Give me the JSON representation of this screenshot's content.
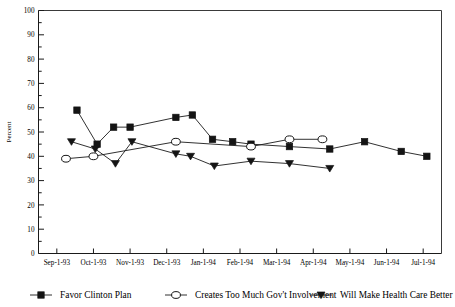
{
  "chart_data": {
    "type": "line",
    "title": "",
    "xlabel": "",
    "ylabel": "Percent",
    "ylim": [
      0,
      100
    ],
    "ytick_step": 10,
    "yminor_step": 5,
    "grid": false,
    "legend_position": "bottom",
    "categories": [
      "Sep-1-93",
      "Oct-1-93",
      "Nov-1-93",
      "Dec-1-93",
      "Jan-1-94",
      "Feb-1-94",
      "Mar-1-94",
      "Apr-1-94",
      "May-1-94",
      "Jun-1-94",
      "Jul-1-94"
    ],
    "ytick_labels": [
      "0",
      "10",
      "20",
      "30",
      "40",
      "50",
      "60",
      "70",
      "80",
      "90",
      "100"
    ],
    "series": [
      {
        "name": "Favor Clinton Plan",
        "marker": "filled-square",
        "x": [
          0.55,
          1.1,
          1.55,
          2.0,
          3.25,
          3.7,
          4.25,
          4.8,
          5.3,
          6.35,
          7.45,
          8.4,
          9.4,
          10.1
        ],
        "values": [
          59,
          45,
          52,
          52,
          56,
          57,
          47,
          46,
          45,
          44,
          43,
          46,
          42,
          40
        ]
      },
      {
        "name": "Creates Too Much Gov't Involvement",
        "marker": "open-circle",
        "x": [
          0.25,
          1.0,
          3.25,
          5.3,
          6.35,
          7.25
        ],
        "values": [
          39,
          40,
          46,
          44,
          47,
          47
        ]
      },
      {
        "name": "Will Make Health Care Better",
        "marker": "filled-triangle",
        "x": [
          0.4,
          1.05,
          1.6,
          2.05,
          3.25,
          3.65,
          4.3,
          5.3,
          6.35,
          7.45
        ],
        "values": [
          46,
          43,
          37,
          46,
          41,
          40,
          36,
          38,
          37,
          35
        ]
      }
    ]
  },
  "legend": {
    "items": [
      {
        "label": "Favor Clinton Plan",
        "marker": "filled-square"
      },
      {
        "label": "Creates Too Much Gov't Involvement",
        "marker": "open-circle"
      },
      {
        "label": "Will Make Health Care Better",
        "marker": "filled-triangle"
      }
    ]
  },
  "axes": {
    "y_axis_title": "Percent"
  }
}
